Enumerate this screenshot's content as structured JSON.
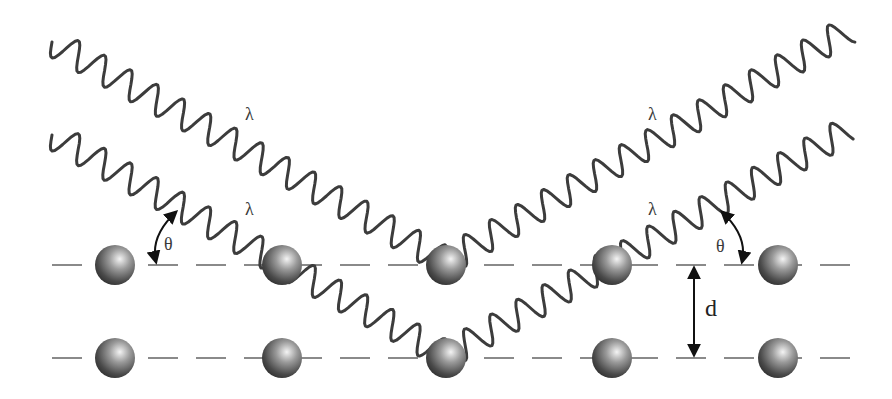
{
  "figure": {
    "labels": {
      "wavelength_upper_incident": "λ",
      "wavelength_lower_incident": "λ",
      "wavelength_upper_reflected": "λ",
      "wavelength_lower_reflected": "λ",
      "angle_incident": "θ",
      "angle_reflected": "θ",
      "plane_spacing": "d"
    },
    "lattice": {
      "rows": 2,
      "atoms_per_row": 5,
      "row_y": [
        265,
        358
      ],
      "atom_x": [
        115,
        282,
        446,
        612,
        778
      ]
    },
    "colors": {
      "wave": "#3c3c3c",
      "plane_line": "#8a8a8a",
      "atom_dark": "#2a2a2a",
      "atom_highlight": "#f2f2f2",
      "arrow": "#111111"
    }
  }
}
